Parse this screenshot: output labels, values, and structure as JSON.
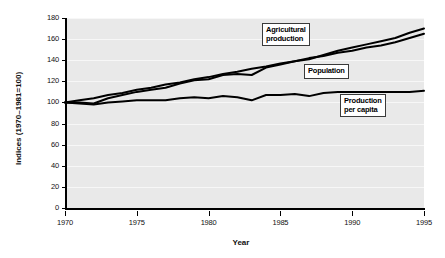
{
  "chart_data": {
    "type": "line",
    "title": "",
    "xlabel": "Year",
    "ylabel": "Indices (1970–1981=100)",
    "xlim": [
      1970,
      1995
    ],
    "ylim": [
      0,
      180
    ],
    "grid": true,
    "legend_position": "inline-callout-boxes",
    "xticks": [
      "1970",
      "1975",
      "1980",
      "1985",
      "1990",
      "1995"
    ],
    "xtick_values": [
      1970,
      1975,
      1980,
      1985,
      1990,
      1995
    ],
    "yticks": [
      "0",
      "20",
      "40",
      "60",
      "80",
      "100",
      "120",
      "140",
      "160",
      "180"
    ],
    "ytick_values": [
      0,
      20,
      40,
      60,
      80,
      100,
      120,
      140,
      160,
      180
    ],
    "x": [
      1970,
      1971,
      1972,
      1973,
      1974,
      1975,
      1976,
      1977,
      1978,
      1979,
      1980,
      1981,
      1982,
      1983,
      1984,
      1985,
      1986,
      1987,
      1988,
      1989,
      1990,
      1991,
      1992,
      1993,
      1994,
      1995
    ],
    "series": [
      {
        "name": "Agricultural production",
        "label": "Agricultural\nproduction",
        "values": [
          100,
          100,
          99,
          104,
          107,
          110,
          112,
          114,
          118,
          121,
          122,
          126,
          127,
          126,
          133,
          136,
          139,
          141,
          145,
          149,
          152,
          155,
          158,
          161,
          166,
          170
        ]
      },
      {
        "name": "Population",
        "label": "Population",
        "values": [
          100,
          102,
          104,
          107,
          109,
          112,
          114,
          117,
          119,
          122,
          124,
          127,
          129,
          132,
          134,
          137,
          139,
          142,
          144,
          147,
          149,
          152,
          154,
          157,
          161,
          165
        ]
      },
      {
        "name": "Production per capita",
        "label": "Production\nper capita",
        "values": [
          100,
          99,
          98,
          100,
          101,
          102,
          102,
          102,
          104,
          105,
          104,
          106,
          105,
          102,
          107,
          107,
          108,
          106,
          109,
          110,
          110,
          110,
          110,
          110,
          110,
          111
        ]
      }
    ],
    "annotations": [
      {
        "name": "agricultural-production-callout",
        "text": "Agricultural\nproduction",
        "x_px": 262,
        "y_px": 23
      },
      {
        "name": "population-callout",
        "text": "Population",
        "x_px": 304,
        "y_px": 64
      },
      {
        "name": "production-per-capita-callout",
        "text": "Production\nper capita",
        "x_px": 340,
        "y_px": 94
      }
    ]
  },
  "axes": {
    "y_title": "Indices (1970–1981=100)",
    "x_title": "Year"
  }
}
